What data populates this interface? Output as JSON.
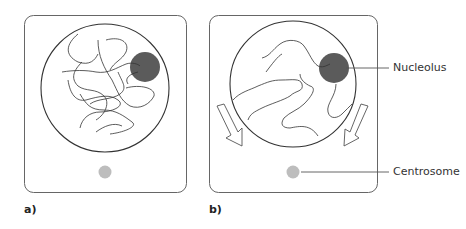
{
  "diagram": {
    "panels": [
      {
        "id": "a",
        "label": "a)"
      },
      {
        "id": "b",
        "label": "b)"
      }
    ],
    "annotations": {
      "nucleolus": "Nucleolus",
      "centrosome": "Centrosome"
    },
    "colors": {
      "outline": "#555555",
      "nucleolus": "#5b5b5b",
      "centrosome": "#bdbdbd",
      "chromatin": "#333333"
    }
  }
}
